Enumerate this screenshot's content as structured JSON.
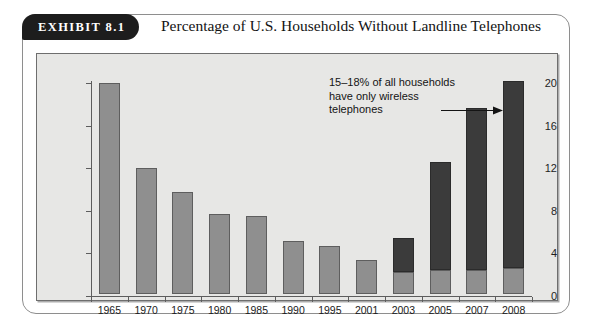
{
  "exhibit": {
    "badge": "EXHIBIT 8.1",
    "title": "Percentage of U.S. Households Without Landline Telephones"
  },
  "annotation": {
    "text": "15–18% of all households have only wireless telephones",
    "target_category": "2008",
    "arrow_icon": "right-arrow-icon"
  },
  "colors": {
    "bar_light": "#8f8f8f",
    "bar_dark": "#3b3b3b",
    "panel_background": "#e7e7e5",
    "badge_background": "#1d1d1d",
    "axis": "#5d5d5d"
  },
  "chart_data": {
    "type": "bar",
    "title": "Percentage of U.S. Households Without Landline Telephones",
    "xlabel": "",
    "ylabel": "",
    "ylim": [
      0,
      20
    ],
    "yticks": [
      0,
      4,
      8,
      12,
      16,
      20
    ],
    "ytick_labels": [
      "0",
      "4",
      "8",
      "12",
      "16",
      "20"
    ],
    "grid": false,
    "legend": "none",
    "stacked": true,
    "categories": [
      "1965",
      "1970",
      "1975",
      "1980",
      "1985",
      "1990",
      "1995",
      "2001",
      "2003",
      "2005",
      "2007",
      "2008"
    ],
    "series": [
      {
        "name": "Households without landline (lower segment)",
        "color": "#8f8f8f",
        "values": [
          19.8,
          11.8,
          9.6,
          7.5,
          7.3,
          5.0,
          4.5,
          3.2,
          2.1,
          2.3,
          2.3,
          2.4
        ]
      },
      {
        "name": "Wireless-only households (upper segment)",
        "color": "#3b3b3b",
        "values": [
          0,
          0,
          0,
          0,
          0,
          0,
          0,
          0,
          3.2,
          10.1,
          15.2,
          17.6
        ]
      }
    ],
    "totals": [
      19.8,
      11.8,
      9.6,
      7.5,
      7.3,
      5.0,
      4.5,
      3.2,
      5.3,
      12.4,
      17.5,
      20.0
    ],
    "annotations": [
      {
        "text": "15–18% of all households have only wireless telephones",
        "points_to": "2008"
      }
    ]
  }
}
